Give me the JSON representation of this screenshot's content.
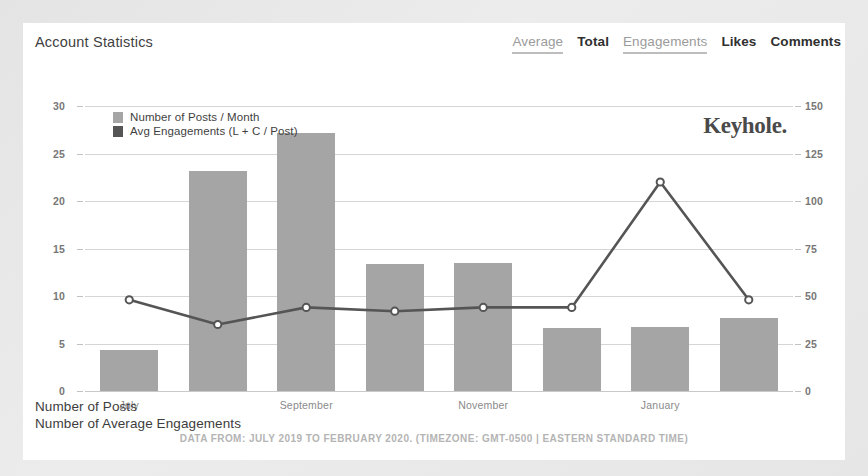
{
  "header": {
    "title": "Account Statistics",
    "tabs": [
      {
        "label": "Average",
        "style": "muted-underlined"
      },
      {
        "label": "Total",
        "style": "dark"
      },
      {
        "label": "Engagements",
        "style": "muted-underlined"
      },
      {
        "label": "Likes",
        "style": "dark"
      },
      {
        "label": "Comments",
        "style": "dark"
      }
    ]
  },
  "watermark": "Keyhole.",
  "axis_captions": [
    "Number of Posts",
    "Number of Average Engagements"
  ],
  "footer": {
    "text": "DATA FROM: JULY 2019 TO FEBRUARY 2020. (TIMEZONE: GMT-0500 | EASTERN STANDARD TIME)"
  },
  "colors": {
    "bar": "#a5a5a5",
    "line": "#555555",
    "marker_fill": "#ffffff",
    "grid": "#d5d5d5",
    "card_bg": "#ffffff",
    "page_bg": "#e8e8e8",
    "tab_active": "#2f2f2f",
    "tab_muted": "#9b9b9b"
  },
  "chart_data": {
    "type": "bar",
    "title": "Account Statistics",
    "xlabel": "",
    "ylabel": "Number of Posts",
    "y2label": "Number of Average Engagements",
    "grid": true,
    "legend_position": "top-left",
    "categories": [
      "July",
      "August",
      "September",
      "October",
      "November",
      "December",
      "January",
      "February"
    ],
    "xtick_labels": [
      "July",
      "September",
      "November",
      "January"
    ],
    "xtick_indices": [
      0,
      2,
      4,
      6
    ],
    "ylim": [
      0,
      30
    ],
    "yticks": [
      0,
      5,
      10,
      15,
      20,
      25,
      30
    ],
    "y2lim": [
      0,
      150
    ],
    "y2ticks": [
      0,
      25,
      50,
      75,
      100,
      125,
      150
    ],
    "series": [
      {
        "name": "Number of Posts / Month",
        "type": "bar",
        "axis": "left",
        "color": "#a5a5a5",
        "values": [
          4.3,
          23.2,
          27.2,
          13.4,
          13.5,
          6.6,
          6.7,
          7.7
        ]
      },
      {
        "name": "Avg Engagements (L + C / Post)",
        "type": "line",
        "axis": "right",
        "color": "#555555",
        "values": [
          48,
          35,
          44,
          42,
          44,
          44,
          110,
          48
        ]
      }
    ]
  }
}
